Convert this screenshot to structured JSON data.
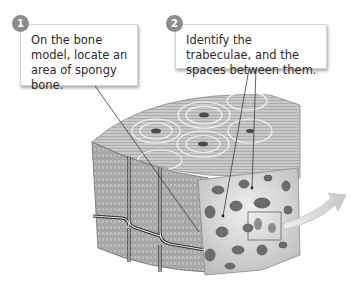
{
  "diagram": {
    "steps": [
      {
        "number": "1",
        "text": "On the bone model, locate an area of spongy bone."
      },
      {
        "number": "2",
        "text": "Identify the trabeculae, and the spaces between them."
      }
    ],
    "illustration": {
      "label": "compact-and-spongy-bone-wedge",
      "arrow": "magnify-arrow"
    },
    "colors": {
      "badge": "#8c8c8c",
      "callout_border": "#d4d4d4",
      "text": "#2b2b2b",
      "bone_light": "#e6e6e6",
      "bone_mid": "#a8a8a8",
      "bone_dark": "#5a5a5a",
      "arrow": "#d0d0d0"
    }
  }
}
